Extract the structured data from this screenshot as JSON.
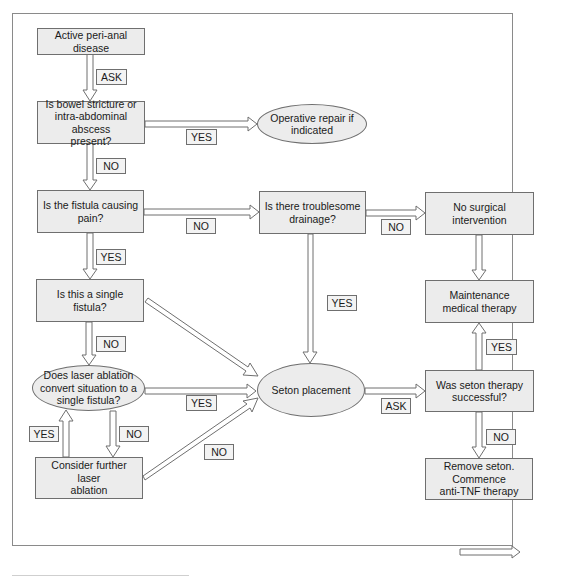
{
  "diagram": {
    "type": "flowchart",
    "nodes": {
      "start": "Active peri-anal disease",
      "bowel_check": "Is bowel stricture or\nintra-abdominal abscess\npresent?",
      "operative_repair": "Operative repair if\nindicated",
      "pain_check": "Is the fistula causing\npain?",
      "drainage_check": "Is there troublesome\ndrainage?",
      "no_surgery": "No surgical\nintervention",
      "single_check": "Is this a single fistula?",
      "maintenance": "Maintenance\nmedical therapy",
      "laser_check": "Does laser ablation\nconvert situation to a\nsingle fistula?",
      "seton": "Seton placement",
      "seton_success": "Was seton therapy\nsuccessful?",
      "further_laser": "Consider further laser\nablation",
      "remove_seton": "Remove seton.\nCommence\nanti-TNF therapy"
    },
    "edge_labels": {
      "start_to_bowel": "ASK",
      "bowel_to_repair": "YES",
      "bowel_to_pain": "NO",
      "pain_to_drainage": "NO",
      "drainage_to_nosurgery": "NO",
      "pain_to_single": "YES",
      "drainage_to_seton": "YES",
      "single_to_laser": "NO",
      "laser_to_seton": "YES",
      "further_to_laser": "YES",
      "laser_to_further": "NO",
      "further_to_seton": "NO",
      "seton_to_success": "ASK",
      "success_to_maintenance": "YES",
      "success_to_remove": "NO"
    },
    "edges": [
      {
        "from": "start",
        "to": "bowel_check",
        "label": "ASK"
      },
      {
        "from": "bowel_check",
        "to": "operative_repair",
        "label": "YES"
      },
      {
        "from": "bowel_check",
        "to": "pain_check",
        "label": "NO"
      },
      {
        "from": "pain_check",
        "to": "drainage_check",
        "label": "NO"
      },
      {
        "from": "drainage_check",
        "to": "no_surgery",
        "label": "NO"
      },
      {
        "from": "no_surgery",
        "to": "maintenance",
        "label": ""
      },
      {
        "from": "pain_check",
        "to": "single_check",
        "label": "YES"
      },
      {
        "from": "drainage_check",
        "to": "seton",
        "label": "YES"
      },
      {
        "from": "single_check",
        "to": "seton",
        "label": ""
      },
      {
        "from": "single_check",
        "to": "laser_check",
        "label": "NO"
      },
      {
        "from": "laser_check",
        "to": "seton",
        "label": "YES"
      },
      {
        "from": "laser_check",
        "to": "further_laser",
        "label": "NO"
      },
      {
        "from": "further_laser",
        "to": "laser_check",
        "label": "YES"
      },
      {
        "from": "further_laser",
        "to": "seton",
        "label": "NO"
      },
      {
        "from": "seton",
        "to": "seton_success",
        "label": "ASK"
      },
      {
        "from": "seton_success",
        "to": "maintenance",
        "label": "YES"
      },
      {
        "from": "seton_success",
        "to": "remove_seton",
        "label": "NO"
      }
    ],
    "legend": {
      "icon": "hollow-arrow-right-icon"
    },
    "colors": {
      "node_fill": "#ececec",
      "node_border": "#6f6f6f",
      "frame_border": "#8a8a8a",
      "label_fill": "#f3f3f3"
    }
  }
}
